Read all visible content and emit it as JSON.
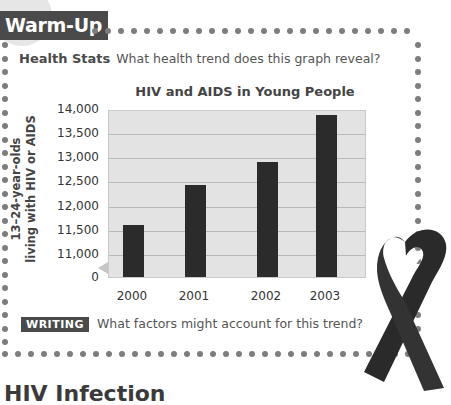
{
  "header": {
    "tab_label": "Warm-Up"
  },
  "prompt": {
    "lead": "Health Stats",
    "question": "What health trend does this graph reveal?"
  },
  "chart_data": {
    "type": "bar",
    "title": "HIV and AIDS in Young People",
    "xlabel": "",
    "ylabel": "13–24-year-olds living with HIV or AIDS",
    "ylabel_lines": [
      "13–24-year-olds",
      "living with HIV or AIDS"
    ],
    "categories": [
      "2000",
      "2001",
      "2002",
      "2003"
    ],
    "values": [
      11600,
      12420,
      12900,
      13870
    ],
    "ylim": [
      11000,
      14000
    ],
    "axis_break": true,
    "yticks": [
      "14,000",
      "13,500",
      "13,000",
      "12,500",
      "12,000",
      "11,500",
      "11,000",
      "0"
    ],
    "grid": true,
    "bar_color": "#2b2b2b",
    "plot_background": "#e3e3e3"
  },
  "writing": {
    "badge": "WRITING",
    "question": "What factors might account for this trend?"
  },
  "bottom_heading": "HIV Infection",
  "decoration": {
    "ribbon": "awareness-ribbon"
  },
  "colors": {
    "tab": "#4a4a4a",
    "dots": "#7d7d7d",
    "text": "#555555"
  }
}
